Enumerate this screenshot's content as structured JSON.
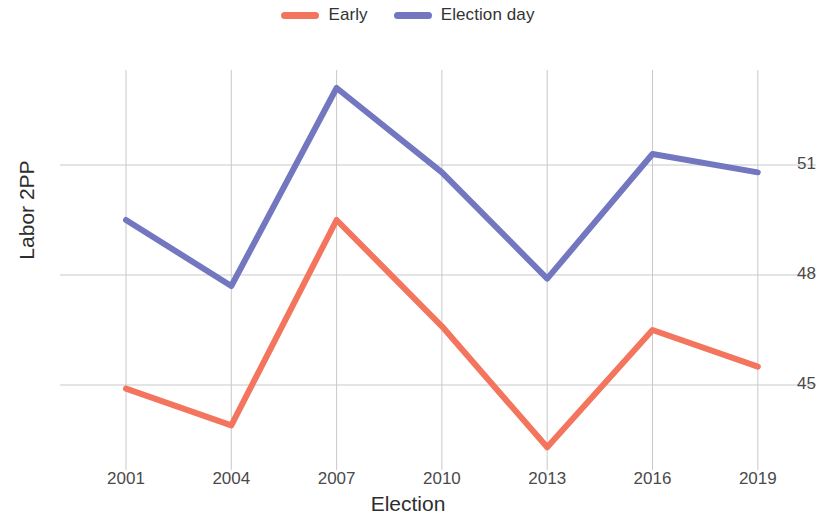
{
  "chart_data": {
    "type": "line",
    "title": "",
    "xlabel": "Election",
    "ylabel": "Labor 2PP",
    "categories": [
      "2001",
      "2004",
      "2007",
      "2010",
      "2013",
      "2016",
      "2019"
    ],
    "x": [
      2001,
      2004,
      2007,
      2010,
      2013,
      2016,
      2019
    ],
    "xlim": [
      2000,
      2020.5
    ],
    "ylim": [
      42.6,
      53.6
    ],
    "yticks": [
      45,
      48,
      51
    ],
    "ytick_labels": [
      "45",
      "48",
      "51"
    ],
    "xticks": [
      2001,
      2004,
      2007,
      2010,
      2013,
      2016,
      2019
    ],
    "grid": true,
    "legend_position": "top-center",
    "series": [
      {
        "name": "Early",
        "color": "#f4755e",
        "values": [
          44.9,
          43.9,
          49.5,
          46.6,
          43.3,
          46.5,
          45.5
        ]
      },
      {
        "name": "Election day",
        "color": "#7277c0",
        "values": [
          49.5,
          47.7,
          53.1,
          50.8,
          47.9,
          51.3,
          50.8
        ]
      }
    ]
  },
  "legend": {
    "entries": [
      {
        "label": "Early",
        "color": "#f4755e"
      },
      {
        "label": "Election day",
        "color": "#7277c0"
      }
    ]
  },
  "axes": {
    "y_title": "Labor 2PP",
    "x_title": "Election",
    "y_tick_labels": [
      "51",
      "48",
      "45"
    ],
    "x_tick_labels": [
      "2001",
      "2004",
      "2007",
      "2010",
      "2013",
      "2016",
      "2019"
    ]
  },
  "colors": {
    "early": "#f4755e",
    "election_day": "#7277c0",
    "grid": "#c9c9c9",
    "text": "#3c3c3c",
    "background": "#ffffff"
  }
}
